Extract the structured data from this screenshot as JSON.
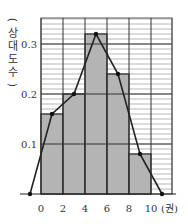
{
  "chart_data": {
    "type": "bar",
    "subtype": "histogram_with_frequency_polygon",
    "title": "",
    "xlabel": "(권)",
    "ylabel": "(상대도수)",
    "bin_edges": [
      0,
      2,
      4,
      6,
      8,
      10
    ],
    "categories": [
      "0~2",
      "2~4",
      "4~6",
      "6~8",
      "8~10"
    ],
    "values": [
      0.16,
      0.2,
      0.32,
      0.24,
      0.08
    ],
    "polygon_points": [
      {
        "x": -1,
        "y": 0
      },
      {
        "x": 1,
        "y": 0.16
      },
      {
        "x": 3,
        "y": 0.2
      },
      {
        "x": 5,
        "y": 0.32
      },
      {
        "x": 7,
        "y": 0.24
      },
      {
        "x": 9,
        "y": 0.08
      },
      {
        "x": 11,
        "y": 0
      }
    ],
    "x_ticks": [
      "0",
      "2",
      "4",
      "6",
      "8",
      "10"
    ],
    "y_ticks": [
      "0.1",
      "0.2",
      "0.3"
    ],
    "ylim": [
      0,
      0.35
    ],
    "xlim": [
      0,
      12
    ],
    "grid": true,
    "minor_grid_step": 0.01,
    "legend": null,
    "colors": {
      "bar": "#b4b4b4",
      "line": "#222222",
      "grid": "#555555"
    }
  },
  "axis": {
    "x_unit": "(권)",
    "y_label_chars": [
      "(",
      "상",
      "대",
      "도",
      "수",
      ")"
    ]
  }
}
